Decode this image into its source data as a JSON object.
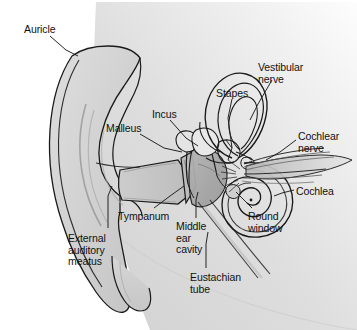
{
  "figure": {
    "background_color": "#ffffff",
    "line_color": "#1a1a1a",
    "text_color": "#111111",
    "head_fill": "#d8d8d8",
    "auricle_fill": "#d2d2d2",
    "canal_fill": "#c9c9c9",
    "cavity_fill": "#a8a8a8"
  },
  "labels": [
    {
      "id": "auricle",
      "text": "Auricle",
      "x": 24,
      "y": 24
    },
    {
      "id": "vestibular-nerve",
      "text": "Vestibular\nnerve",
      "x": 258,
      "y": 62
    },
    {
      "id": "stapes",
      "text": "Stapes",
      "x": 216,
      "y": 88
    },
    {
      "id": "incus",
      "text": "Incus",
      "x": 152,
      "y": 109
    },
    {
      "id": "malleus",
      "text": "Malleus",
      "x": 106,
      "y": 123
    },
    {
      "id": "cochlear-nerve",
      "text": "Cochlear\nnerve",
      "x": 298,
      "y": 131
    },
    {
      "id": "cochlea",
      "text": "Cochlea",
      "x": 296,
      "y": 186
    },
    {
      "id": "tympanum",
      "text": "Tympanum",
      "x": 118,
      "y": 211
    },
    {
      "id": "middle-ear-cavity",
      "text": "Middle\near\ncavity",
      "x": 176,
      "y": 221
    },
    {
      "id": "round-window",
      "text": "Round\nwindow",
      "x": 248,
      "y": 211
    },
    {
      "id": "external-auditory-meatus",
      "text": "External\nauditory\nmeatus",
      "x": 68,
      "y": 233
    },
    {
      "id": "eustachian-tube",
      "text": "Eustachian\ntube",
      "x": 190,
      "y": 272
    }
  ]
}
